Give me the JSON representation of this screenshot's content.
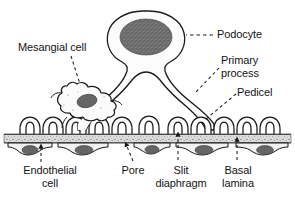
{
  "figure": {
    "background_color": "#ffffff",
    "line_color": "#1a1a1a",
    "nucleus_color": "#6b6b6b",
    "basal_lamina_color": "#d8d8d8",
    "cytoplasm_color": "#fbfbfb"
  },
  "labels": [
    {
      "id": "mesangial-cell",
      "text": "Mesangial cell",
      "x": 18,
      "y": 41,
      "align": "left"
    },
    {
      "id": "podocyte",
      "text": "Podocyte",
      "x": 217,
      "y": 31,
      "align": "left"
    },
    {
      "id": "primary-process",
      "text": "Primary\nprocess",
      "x": 221,
      "y": 58,
      "align": "left"
    },
    {
      "id": "pedicel",
      "text": "Pedicel",
      "x": 237,
      "y": 88,
      "align": "left"
    },
    {
      "id": "endothelial-cell",
      "text": "Endothelial\ncell",
      "x": 14,
      "y": 164,
      "align": "left"
    },
    {
      "id": "pore",
      "text": "Pore",
      "x": 124,
      "y": 164,
      "align": "left"
    },
    {
      "id": "slit-diaphragm",
      "text": "Slit\ndiaphragm",
      "x": 161,
      "y": 164,
      "align": "left"
    },
    {
      "id": "basal-lamina",
      "text": "Basal\nlamina",
      "x": 230,
      "y": 164,
      "align": "left"
    }
  ],
  "structures": {
    "podocyte_cell_body": "podocyte-cell-body",
    "podocyte_nucleus": "podocyte-nucleus",
    "mesangial_cell_body": "mesangial-cell-body",
    "mesangial_nucleus": "mesangial-nucleus",
    "primary_process_left": "primary-process-left",
    "primary_process_right": "primary-process-right",
    "basal_lamina_band": "basal-lamina-band",
    "endothelial_layer": "endothelial-cell-layer",
    "pedicel_count": 12,
    "endothelial_cell_count": 6
  },
  "leader_lines": [
    {
      "id": "leader-podocyte",
      "style": "dashed"
    },
    {
      "id": "leader-mesangial-cell",
      "style": "dashed"
    },
    {
      "id": "leader-primary-process",
      "style": "dashed"
    },
    {
      "id": "leader-pedicel",
      "style": "dashed"
    },
    {
      "id": "leader-endothelial-cell",
      "style": "dashed-arrow"
    },
    {
      "id": "leader-pore",
      "style": "dashed-arrow"
    },
    {
      "id": "leader-slit-diaphragm",
      "style": "dashed-arrow"
    },
    {
      "id": "leader-basal-lamina",
      "style": "dashed-arrow"
    }
  ]
}
